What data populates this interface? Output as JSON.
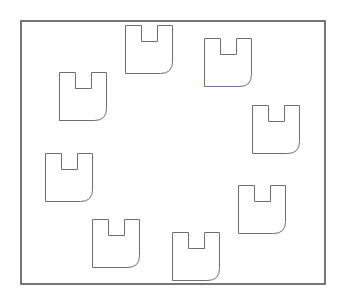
{
  "diagram": {
    "background": "#ffffff",
    "frame": {
      "x": 21,
      "y": 21,
      "width": 304,
      "height": 263,
      "stroke": "#555555",
      "stroke_width": 1.6
    },
    "shape_style": {
      "stroke": "#6e6e6e",
      "stroke_width": 1,
      "fill": "none",
      "width": 47,
      "height": 48,
      "notch_left_offset": 16,
      "notch_width": 16,
      "notch_depth": 16,
      "corner_radius": 12
    },
    "shapes": [
      {
        "id": "piece-1",
        "x": 125,
        "y": 25
      },
      {
        "id": "piece-2",
        "x": 204,
        "y": 38,
        "bottom_edge_color": "#6b6bd6"
      },
      {
        "id": "piece-3",
        "x": 252,
        "y": 105
      },
      {
        "id": "piece-4",
        "x": 238,
        "y": 185
      },
      {
        "id": "piece-5",
        "x": 172,
        "y": 232
      },
      {
        "id": "piece-6",
        "x": 92,
        "y": 219
      },
      {
        "id": "piece-7",
        "x": 45,
        "y": 153
      },
      {
        "id": "piece-8",
        "x": 59,
        "y": 72
      }
    ]
  }
}
